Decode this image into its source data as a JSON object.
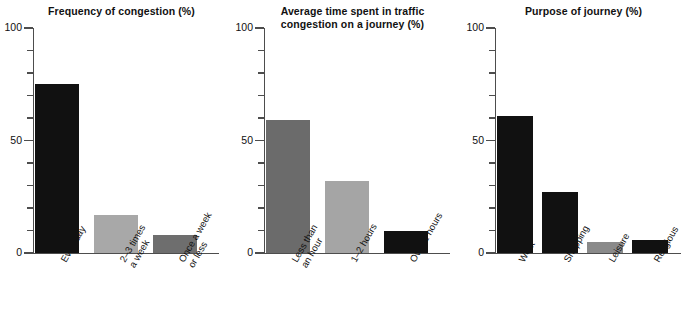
{
  "figure": {
    "axis_color": "#4d4d4d",
    "background": "#ffffff"
  },
  "chart_data": [
    {
      "type": "bar",
      "title": "Frequency of congestion (%)",
      "title_lines": [
        "Frequency of congestion (%)"
      ],
      "categories": [
        "Everyday",
        "2–3 times a week",
        "Once a week or less"
      ],
      "category_lines": [
        [
          "Everyday"
        ],
        [
          "2–3 times",
          "a week"
        ],
        [
          "Once a week",
          "or less"
        ]
      ],
      "values": [
        75,
        17,
        8
      ],
      "colors": [
        "#111111",
        "#a8a8a8",
        "#6e6e6e"
      ],
      "xlabel": "",
      "ylabel": "",
      "ylim": [
        0,
        100
      ],
      "yticks": [
        0,
        50,
        100
      ],
      "ytick_labels": [
        "0",
        "50",
        "100"
      ],
      "yminor_step": 10,
      "grid": false,
      "legend": "none"
    },
    {
      "type": "bar",
      "title": "Average time spent in traffic congestion on a journey (%)",
      "title_lines": [
        "Average time spent in traffic",
        "congestion on a journey (%)"
      ],
      "categories": [
        "Less than an hour",
        "1–2 hours",
        "Over 2 hours"
      ],
      "category_lines": [
        [
          "Less than",
          "an hour"
        ],
        [
          "1–2 hours"
        ],
        [
          "Over 2 hours"
        ]
      ],
      "values": [
        59,
        32,
        10
      ],
      "colors": [
        "#6b6b6b",
        "#a5a5a5",
        "#111111"
      ],
      "xlabel": "",
      "ylabel": "",
      "ylim": [
        0,
        100
      ],
      "yticks": [
        0,
        50,
        100
      ],
      "ytick_labels": [
        "0",
        "50",
        "100"
      ],
      "yminor_step": 10,
      "grid": false,
      "legend": "none"
    },
    {
      "type": "bar",
      "title": "Purpose of journey (%)",
      "title_lines": [
        "Purpose of journey (%)"
      ],
      "categories": [
        "Work",
        "Shopping",
        "Leisure",
        "Religious"
      ],
      "category_lines": [
        [
          "Work"
        ],
        [
          "Shopping"
        ],
        [
          "Leisure"
        ],
        [
          "Religious"
        ]
      ],
      "values": [
        61,
        27,
        5,
        6
      ],
      "colors": [
        "#111111",
        "#111111",
        "#8a8a8a",
        "#111111"
      ],
      "xlabel": "",
      "ylabel": "",
      "ylim": [
        0,
        100
      ],
      "yticks": [
        0,
        50,
        100
      ],
      "ytick_labels": [
        "0",
        "50",
        "100"
      ],
      "yminor_step": 10,
      "grid": false,
      "legend": "none"
    }
  ]
}
